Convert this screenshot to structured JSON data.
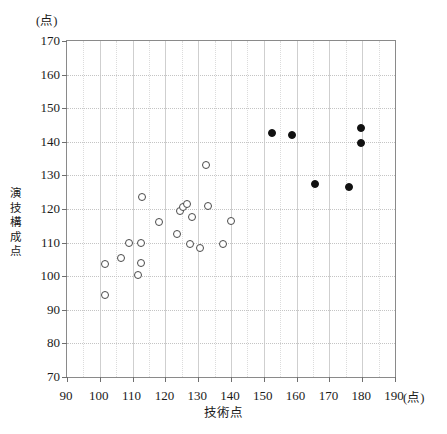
{
  "chart_data": {
    "type": "scatter",
    "title": "",
    "xlabel": "技術点",
    "ylabel": "演技構成点",
    "xunit": "(点)",
    "yunit": "(点)",
    "xlim": [
      90,
      190
    ],
    "ylim": [
      70,
      170
    ],
    "xticks": [
      90,
      100,
      110,
      120,
      130,
      140,
      150,
      160,
      170,
      180,
      190
    ],
    "yticks": [
      70,
      80,
      90,
      100,
      110,
      120,
      130,
      140,
      150,
      160,
      170
    ],
    "grid": true,
    "legend": "none",
    "series": [
      {
        "name": "open-circles",
        "marker": "open-circle",
        "color": "#4a4a4a",
        "points": [
          [
            101.5,
            94.5
          ],
          [
            101.5,
            103.5
          ],
          [
            106.5,
            105.5
          ],
          [
            109.0,
            110.0
          ],
          [
            111.5,
            100.5
          ],
          [
            112.5,
            104.0
          ],
          [
            112.5,
            110.0
          ],
          [
            113.0,
            123.5
          ],
          [
            118.0,
            116.0
          ],
          [
            123.5,
            112.5
          ],
          [
            124.5,
            119.5
          ],
          [
            125.5,
            120.5
          ],
          [
            126.5,
            121.5
          ],
          [
            127.5,
            109.5
          ],
          [
            128.0,
            117.5
          ],
          [
            130.5,
            108.5
          ],
          [
            132.5,
            133.0
          ],
          [
            133.0,
            121.0
          ],
          [
            137.5,
            109.5
          ],
          [
            140.0,
            116.5
          ]
        ]
      },
      {
        "name": "filled-circles",
        "marker": "filled-circle",
        "color": "#111111",
        "points": [
          [
            152.5,
            142.5
          ],
          [
            158.5,
            142.0
          ],
          [
            165.5,
            127.5
          ],
          [
            176.0,
            126.5
          ],
          [
            179.5,
            144.0
          ],
          [
            179.5,
            139.5
          ]
        ]
      }
    ]
  },
  "caption": ""
}
